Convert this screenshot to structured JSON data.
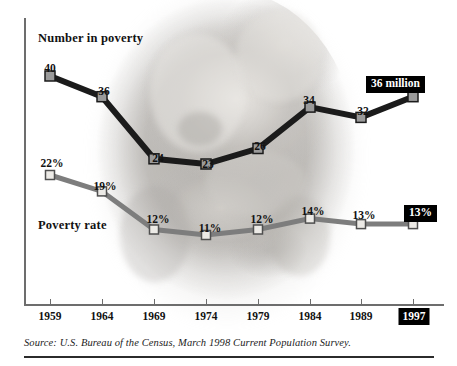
{
  "chart_data": {
    "type": "line",
    "title": "",
    "xlabel": "",
    "ylabel": "",
    "grid": false,
    "legend_position": "inline-labels",
    "categories": [
      "1959",
      "1964",
      "1969",
      "1974",
      "1979",
      "1984",
      "1989",
      "1997"
    ],
    "highlighted_category": "1997",
    "series": [
      {
        "name": "Number in poverty",
        "unit": "millions",
        "values": [
          40,
          36,
          24,
          23,
          26,
          34,
          32,
          36
        ],
        "point_labels": [
          "40",
          "36",
          "24",
          "23",
          "26",
          "34",
          "32",
          ""
        ],
        "end_callout": "36 million",
        "line_color": "#1b1b1b",
        "marker_fill": "#9a9a9a",
        "marker_stroke": "#1b1b1b"
      },
      {
        "name": "Poverty rate",
        "unit": "percent",
        "values": [
          22,
          19,
          12,
          11,
          12,
          14,
          13,
          13
        ],
        "point_labels": [
          "22%",
          "19%",
          "12%",
          "11%",
          "12%",
          "14%",
          "13%",
          ""
        ],
        "end_callout": "13%",
        "line_color": "#7d7d7d",
        "marker_fill": "#eceae6",
        "marker_stroke": "#4f4f4f"
      }
    ],
    "annotations": [
      {
        "text": "Number in poverty"
      },
      {
        "text": "Poverty rate"
      }
    ],
    "axis": {
      "x_tick_labels": [
        "1959",
        "1964",
        "1969",
        "1974",
        "1979",
        "1984",
        "1989",
        "1997"
      ],
      "y_axis_visible": true,
      "y_tick_labels": []
    },
    "colors": {
      "number_line": "#1b1b1b",
      "rate_line": "#7d7d7d",
      "axis": "#6d6d6d",
      "callout_bg": "#000000",
      "callout_text": "#ffffff",
      "text": "#121212"
    }
  },
  "source": {
    "text": "Source: U.S. Bureau of the Census, March 1998 Current Population Survey."
  },
  "background": {
    "description": "faded oval photograph of an elderly couple embracing"
  }
}
